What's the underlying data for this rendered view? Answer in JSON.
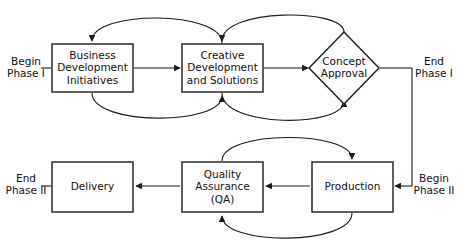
{
  "diagram": {
    "background_color": "#ffffff",
    "line_color": "#1a1a1a",
    "text_color": "#111111",
    "nodes": [
      {
        "id": "business-development-initiatives",
        "shape": "rectangle",
        "lines": [
          "Business",
          "Development",
          "Initiatives"
        ],
        "x": 52,
        "y": 44,
        "w": 81,
        "h": 48
      },
      {
        "id": "creative-development-and-solutions",
        "shape": "rectangle",
        "lines": [
          "Creative",
          "Development",
          "and Solutions"
        ],
        "x": 182,
        "y": 44,
        "w": 81,
        "h": 48
      },
      {
        "id": "concept-approval",
        "shape": "diamond",
        "lines": [
          "Concept",
          "Approval"
        ],
        "cx": 344,
        "cy": 68,
        "rx": 35,
        "ry": 36
      },
      {
        "id": "delivery",
        "shape": "rectangle",
        "lines": [
          "Delivery"
        ],
        "x": 52,
        "y": 162,
        "w": 81,
        "h": 50
      },
      {
        "id": "quality-assurance",
        "shape": "rectangle",
        "lines": [
          "Quality",
          "Assurance",
          "(QA)"
        ],
        "x": 182,
        "y": 162,
        "w": 81,
        "h": 50
      },
      {
        "id": "production",
        "shape": "rectangle",
        "lines": [
          "Production"
        ],
        "x": 312,
        "y": 162,
        "w": 81,
        "h": 50
      }
    ],
    "phase_labels": [
      {
        "id": "begin-phase-1",
        "lines": [
          "Begin",
          "Phase I"
        ],
        "x": 26,
        "y": 68
      },
      {
        "id": "end-phase-1",
        "lines": [
          "End",
          "Phase I"
        ],
        "x": 434,
        "y": 68
      },
      {
        "id": "end-phase-2",
        "lines": [
          "End",
          "Phase II"
        ],
        "x": 26,
        "y": 185
      },
      {
        "id": "begin-phase-2",
        "lines": [
          "Begin",
          "Phase II"
        ],
        "x": 434,
        "y": 185
      }
    ],
    "edges": [
      {
        "id": "begin-phase1-to-business-dev",
        "type": "line",
        "d": "M 41 68 L 51 68",
        "arrow": false
      },
      {
        "id": "business-dev-to-creative-dev",
        "type": "line",
        "d": "M 134 68 L 180 68",
        "arrow": true
      },
      {
        "id": "creative-dev-to-concept-approval",
        "type": "line",
        "d": "M 264 68 L 308 68",
        "arrow": true
      },
      {
        "id": "concept-approval-to-end-phase1",
        "type": "line",
        "d": "M 380 68 L 412 68",
        "arrow": false
      },
      {
        "id": "end-phase1-down-to-begin-phase2",
        "type": "line",
        "d": "M 412 68 L 412 186",
        "arrow": false
      },
      {
        "id": "begin-phase2-to-production",
        "type": "line",
        "d": "M 412 186 L 395 186",
        "arrow": true
      },
      {
        "id": "production-to-quality-assurance",
        "type": "line",
        "d": "M 310 186 L 266 186",
        "arrow": true
      },
      {
        "id": "quality-assurance-to-delivery",
        "type": "line",
        "d": "M 180 186 L 136 186",
        "arrow": true
      },
      {
        "id": "delivery-to-end-phase2",
        "type": "line",
        "d": "M 51 186 L 41 186",
        "arrow": false
      },
      {
        "id": "creative-dev-back-to-business-dev",
        "type": "curve",
        "d": "M 222 43 C 222 10, 92 10, 92 41",
        "arrow": true
      },
      {
        "id": "concept-approval-back-to-creative-dev",
        "type": "curve",
        "d": "M 344 32 C 344 8, 222 8, 222 41",
        "arrow": true
      },
      {
        "id": "business-dev-forward-to-creative-dev",
        "type": "curve",
        "d": "M 92 93 C 92 126, 222 126, 222 96",
        "arrow": true
      },
      {
        "id": "creative-dev-forward-to-concept-approval",
        "type": "curve",
        "d": "M 222 93 C 222 128, 344 128, 344 101",
        "arrow": true
      },
      {
        "id": "quality-assurance-to-production-loop",
        "type": "curve",
        "d": "M 222 161 C 222 130, 352 130, 352 159",
        "arrow": true
      },
      {
        "id": "production-back-to-quality-assurance-loop",
        "type": "curve",
        "d": "M 352 213 C 352 246, 222 246, 222 216",
        "arrow": true
      }
    ]
  }
}
